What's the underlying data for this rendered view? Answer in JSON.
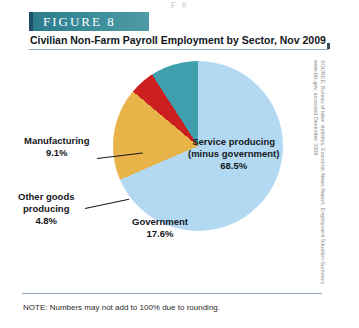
{
  "figure": {
    "banner_label": "FIGURE  8",
    "subtitle": "Civilian Non-Farm Payroll Employment by Sector, Nov 2009",
    "top_bleed_text": "F  8",
    "note": "NOTE: Numbers may not add to 100% due to rounding.",
    "source": "SOURCE: Bureau of labor statistics, Economic News Report, Employment Situation Summary www.bls.gov, accessed December 2009"
  },
  "labels": {
    "service_name_line1": "Service producing",
    "service_name_line2": "(minus government)",
    "service_value": "68.5%",
    "government_name": "Government",
    "government_value": "17.6%",
    "manufacturing_name": "Manufacturing",
    "manufacturing_value": "9.1%",
    "other_name_line1": "Other goods",
    "other_name_line2": "producing",
    "other_value": "4.8%"
  },
  "colors": {
    "service": "#b3d9f2",
    "government": "#e8b349",
    "other_goods": "#cc1f1f",
    "manufacturing": "#3f9fad",
    "banner": "#3d8f9c",
    "banner_edge": "#1f4f68",
    "rule": "#8fa8bd"
  },
  "chart_data": {
    "type": "pie",
    "title": "Civilian Non-Farm Payroll Employment by Sector, Nov 2009",
    "subtitle": "",
    "xlabel": "",
    "ylabel": "",
    "categories": [
      "Service producing (minus government)",
      "Government",
      "Other goods producing",
      "Manufacturing"
    ],
    "values": [
      68.5,
      17.6,
      4.8,
      9.1
    ],
    "units": "percent",
    "colors": [
      "#b3d9f2",
      "#e8b349",
      "#cc1f1f",
      "#3f9fad"
    ],
    "start_angle_deg": 0,
    "direction": "clockwise",
    "legend": "none",
    "grid": false,
    "data_labels": [
      "68.5%",
      "17.6%",
      "4.8%",
      "9.1%"
    ],
    "annotations": [
      "NOTE: Numbers may not add to 100% due to rounding."
    ]
  }
}
